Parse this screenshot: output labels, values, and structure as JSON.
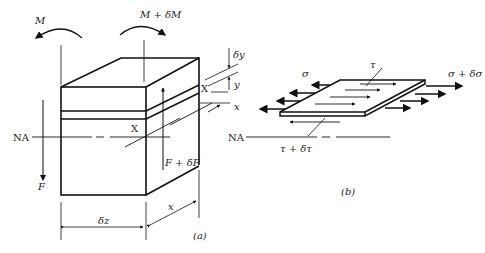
{
  "figure_a": {
    "caption": "(a)",
    "moment_left": "M",
    "moment_right": "M + δM",
    "force_left": "F",
    "force_right": "F + δF",
    "neutral_axis": "NA",
    "section_mark_top": "X",
    "section_mark_mid": "X",
    "delta_y": "δy",
    "y": "y",
    "x_axis": "x",
    "width_dim": "δz",
    "depth_dim": "x"
  },
  "figure_b": {
    "caption": "(b)",
    "sigma": "σ",
    "sigma_plus": "σ + δσ",
    "tau": "τ",
    "tau_plus": "τ + δτ",
    "neutral_axis": "NA"
  }
}
